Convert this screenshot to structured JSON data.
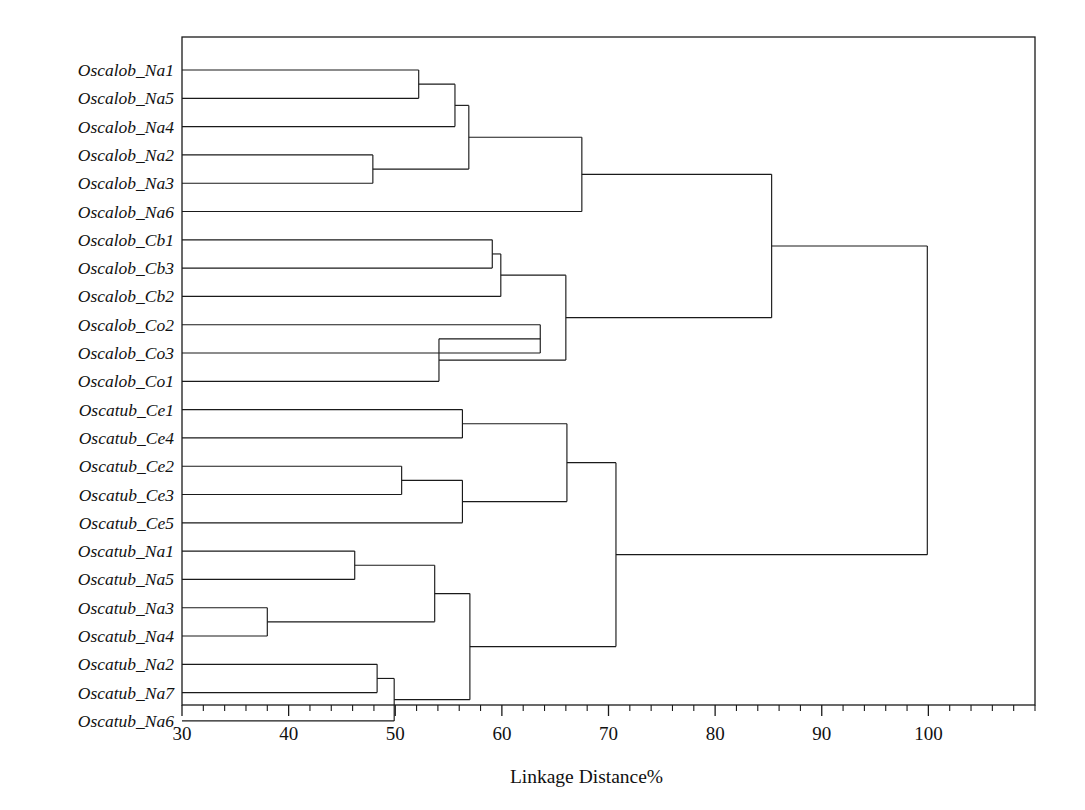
{
  "chart_data": {
    "type": "dendrogram",
    "title": "",
    "xlabel": "Linkage Distance%",
    "ylabel": "",
    "xlim": [
      30,
      110
    ],
    "xticks": [
      30,
      40,
      50,
      60,
      70,
      80,
      90,
      100
    ],
    "xtick_labels": [
      "30",
      "40",
      "50",
      "60",
      "70",
      "80",
      "90",
      "100"
    ],
    "minor_tick_step": 2,
    "grid": false,
    "legend": null,
    "orientation": "horizontal-left-to-right",
    "leaves": [
      "Oscalob_Na1",
      "Oscalob_Na5",
      "Oscalob_Na4",
      "Oscalob_Na2",
      "Oscalob_Na3",
      "Oscalob_Na6",
      "Oscalob_Cb1",
      "Oscalob_Cb3",
      "Oscalob_Cb2",
      "Oscalob_Co2",
      "Oscalob_Co3",
      "Oscalob_Co1",
      "Oscatub_Ce1",
      "Oscatub_Ce4",
      "Oscatub_Ce2",
      "Oscatub_Ce3",
      "Oscatub_Ce5",
      "Oscatub_Na1",
      "Oscatub_Na5",
      "Oscatub_Na3",
      "Oscatub_Na4",
      "Oscatub_Na2",
      "Oscatub_Na7",
      "Oscatub_Na6"
    ],
    "merges": [
      {
        "id": "m1",
        "left": "Oscalob_Na1",
        "right": "Oscalob_Na5",
        "distance": 52.2
      },
      {
        "id": "m2",
        "left": "m1",
        "right": "Oscalob_Na4",
        "distance": 55.6
      },
      {
        "id": "m3",
        "left": "Oscalob_Na2",
        "right": "Oscalob_Na3",
        "distance": 47.9
      },
      {
        "id": "m4",
        "left": "m2",
        "right": "m3",
        "distance": 56.9
      },
      {
        "id": "m5",
        "left": "m4",
        "right": "Oscalob_Na6",
        "distance": 67.5
      },
      {
        "id": "m6",
        "left": "Oscalob_Cb1",
        "right": "Oscalob_Cb3",
        "distance": 59.1
      },
      {
        "id": "m7",
        "left": "m6",
        "right": "Oscalob_Cb2",
        "distance": 59.9
      },
      {
        "id": "m8",
        "left": "Oscalob_Co2",
        "right": "Oscalob_Co3",
        "distance": 63.6
      },
      {
        "id": "m9",
        "left": "m8",
        "right": "Oscalob_Co1",
        "distance": 54.1
      },
      {
        "id": "m10",
        "left": "m7",
        "right": "m9",
        "distance": 66.0
      },
      {
        "id": "m11",
        "left": "m5",
        "right": "m10",
        "distance": 85.3
      },
      {
        "id": "m12",
        "left": "Oscatub_Ce1",
        "right": "Oscatub_Ce4",
        "distance": 56.3
      },
      {
        "id": "m13",
        "left": "Oscatub_Ce2",
        "right": "Oscatub_Ce3",
        "distance": 50.6
      },
      {
        "id": "m14",
        "left": "m13",
        "right": "Oscatub_Ce5",
        "distance": 56.3
      },
      {
        "id": "m15",
        "left": "m12",
        "right": "m14",
        "distance": 66.1
      },
      {
        "id": "m16",
        "left": "Oscatub_Na1",
        "right": "Oscatub_Na5",
        "distance": 46.2
      },
      {
        "id": "m17",
        "left": "Oscatub_Na3",
        "right": "Oscatub_Na4",
        "distance": 38.0
      },
      {
        "id": "m18",
        "left": "m16",
        "right": "m17",
        "distance": 53.7
      },
      {
        "id": "m19",
        "left": "Oscatub_Na2",
        "right": "Oscatub_Na7",
        "distance": 48.3
      },
      {
        "id": "m20",
        "left": "m19",
        "right": "Oscatub_Na6",
        "distance": 49.9
      },
      {
        "id": "m21",
        "left": "m18",
        "right": "m20",
        "distance": 57.0
      },
      {
        "id": "m22",
        "left": "m15",
        "right": "m21",
        "distance": 70.7
      },
      {
        "id": "m23",
        "left": "m11",
        "right": "m22",
        "distance": 99.9
      }
    ]
  },
  "axis": {
    "title": "Linkage Distance%"
  }
}
